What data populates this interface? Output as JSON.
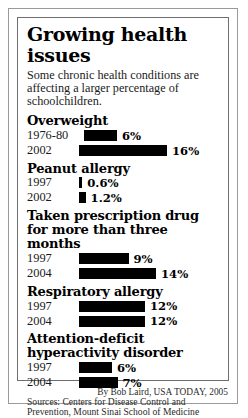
{
  "title": "Growing health issues",
  "subtitle": "Some chronic health conditions are affecting a larger percentage of schoolchildren.",
  "sources": "Sources: Centers for Disease Control and Prevention, Mount Sinai School of Medicine",
  "credit": "By Bob Laird, USA TODAY, 2005",
  "sections": [
    {
      "title": "Overweight",
      "rows": [
        {
          "label": "1976-80",
          "value": "6%"
        },
        {
          "label": "2002",
          "value": "16%"
        }
      ]
    },
    {
      "title": "Peanut allergy",
      "rows": [
        {
          "label": "1997",
          "value": "0.6%"
        },
        {
          "label": "2002",
          "value": "1.2%"
        }
      ]
    },
    {
      "title": "Taken prescription drug for more than three months",
      "rows": [
        {
          "label": "1997",
          "value": "9%"
        },
        {
          "label": "2004",
          "value": "14%"
        }
      ]
    },
    {
      "title": "Respiratory allergy",
      "rows": [
        {
          "label": "1997",
          "value": "12%"
        },
        {
          "label": "2004",
          "value": "12%"
        }
      ]
    },
    {
      "title": "Attention-deficit hyperactivity disorder",
      "rows": [
        {
          "label": "1997",
          "value": "6%"
        },
        {
          "label": "2004",
          "value": "7%"
        }
      ]
    }
  ],
  "chart_data": {
    "type": "bar",
    "title": "Growing health issues",
    "subtitle": "Some chronic health conditions are affecting a larger percentage of schoolchildren.",
    "xlabel": "Percentage of schoolchildren",
    "ylabel": "",
    "orientation": "horizontal",
    "grid": false,
    "legend": "none",
    "bar_color": "#000000",
    "xlim": [
      0,
      16
    ],
    "groups": [
      {
        "name": "Overweight",
        "categories": [
          "1976-80",
          "2002"
        ],
        "values": [
          6,
          16
        ],
        "labels": [
          "6%",
          "16%"
        ]
      },
      {
        "name": "Peanut allergy",
        "categories": [
          "1997",
          "2002"
        ],
        "values": [
          0.6,
          1.2
        ],
        "labels": [
          "0.6%",
          "1.2%"
        ]
      },
      {
        "name": "Taken prescription drug for more than three months",
        "categories": [
          "1997",
          "2004"
        ],
        "values": [
          9,
          14
        ],
        "labels": [
          "9%",
          "14%"
        ]
      },
      {
        "name": "Respiratory allergy",
        "categories": [
          "1997",
          "2004"
        ],
        "values": [
          12,
          12
        ],
        "labels": [
          "12%",
          "12%"
        ]
      },
      {
        "name": "Attention-deficit hyperactivity disorder",
        "categories": [
          "1997",
          "2004"
        ],
        "values": [
          6,
          7
        ],
        "labels": [
          "6%",
          "7%"
        ]
      }
    ]
  }
}
